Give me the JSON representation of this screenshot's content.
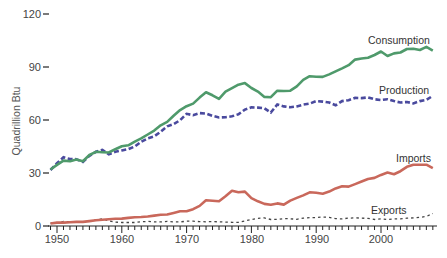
{
  "chart_data": {
    "type": "line",
    "title": "",
    "xlabel": "",
    "ylabel": "Quadrillion Btu",
    "ylim": [
      0,
      120
    ],
    "xlim": [
      1949,
      2008
    ],
    "yticks": [
      0,
      30,
      60,
      90,
      120
    ],
    "xticks": [
      1950,
      1960,
      1970,
      1980,
      1990,
      2000
    ],
    "grid": false,
    "legend": "direct labels at right",
    "x": [
      1949,
      1950,
      1951,
      1952,
      1953,
      1954,
      1955,
      1956,
      1957,
      1958,
      1959,
      1960,
      1961,
      1962,
      1963,
      1964,
      1965,
      1966,
      1967,
      1968,
      1969,
      1970,
      1971,
      1972,
      1973,
      1974,
      1975,
      1976,
      1977,
      1978,
      1979,
      1980,
      1981,
      1982,
      1983,
      1984,
      1985,
      1986,
      1987,
      1988,
      1989,
      1990,
      1991,
      1992,
      1993,
      1994,
      1995,
      1996,
      1997,
      1998,
      1999,
      2000,
      2001,
      2002,
      2003,
      2004,
      2005,
      2006,
      2007,
      2008
    ],
    "series": [
      {
        "name": "Consumption",
        "color": "#4f9a6b",
        "style": "solid",
        "values": [
          32.0,
          34.6,
          37.0,
          36.7,
          37.7,
          36.6,
          40.2,
          42.0,
          41.8,
          41.6,
          43.5,
          45.1,
          45.7,
          47.8,
          49.6,
          51.8,
          54.0,
          57.0,
          58.9,
          62.4,
          65.6,
          67.8,
          69.3,
          72.7,
          75.7,
          74.0,
          72.0,
          76.0,
          78.0,
          80.0,
          80.9,
          78.1,
          76.1,
          73.1,
          72.9,
          76.6,
          76.4,
          76.6,
          79.0,
          82.7,
          84.8,
          84.5,
          84.4,
          85.8,
          87.5,
          89.2,
          91.0,
          94.2,
          94.8,
          95.2,
          96.8,
          98.8,
          96.2,
          97.7,
          98.2,
          100.2,
          100.3,
          99.6,
          101.4,
          99.3
        ]
      },
      {
        "name": "Production",
        "color": "#4a4a9e",
        "style": "dashed",
        "values": [
          31.7,
          35.5,
          38.9,
          37.9,
          37.8,
          36.3,
          39.7,
          42.0,
          43.1,
          40.6,
          42.0,
          42.8,
          43.5,
          45.0,
          47.7,
          49.6,
          50.7,
          53.4,
          56.4,
          57.7,
          59.9,
          63.5,
          62.7,
          63.9,
          63.6,
          62.4,
          61.4,
          61.6,
          62.1,
          63.2,
          65.9,
          67.2,
          67.0,
          66.6,
          64.2,
          68.8,
          67.7,
          67.2,
          67.7,
          68.7,
          69.3,
          70.7,
          70.4,
          69.9,
          68.3,
          70.7,
          71.2,
          72.5,
          72.4,
          72.8,
          71.7,
          71.3,
          71.7,
          70.7,
          69.9,
          70.2,
          69.4,
          70.7,
          71.4,
          73.7
        ]
      },
      {
        "name": "Imports",
        "color": "#c9685b",
        "style": "solid",
        "values": [
          1.4,
          1.9,
          1.9,
          2.1,
          2.3,
          2.3,
          2.8,
          3.2,
          3.5,
          3.8,
          4.1,
          4.2,
          4.6,
          5.0,
          5.1,
          5.4,
          5.9,
          6.4,
          6.5,
          7.4,
          8.3,
          8.3,
          9.5,
          11.4,
          14.6,
          14.3,
          14.0,
          16.8,
          19.9,
          19.1,
          19.5,
          15.8,
          14.0,
          12.5,
          12.0,
          12.8,
          12.1,
          14.4,
          15.9,
          17.3,
          19.1,
          18.8,
          18.3,
          19.5,
          21.3,
          22.5,
          22.3,
          23.7,
          25.2,
          26.6,
          27.2,
          28.9,
          30.2,
          29.3,
          31.0,
          33.5,
          34.7,
          34.7,
          34.7,
          32.8
        ]
      },
      {
        "name": "Exports",
        "color": "#444444",
        "style": "dotted",
        "values": [
          1.6,
          1.5,
          2.6,
          2.4,
          2.3,
          2.3,
          2.8,
          3.4,
          4.1,
          2.9,
          2.2,
          2.0,
          2.0,
          2.0,
          2.4,
          2.6,
          2.4,
          2.3,
          2.6,
          2.3,
          2.3,
          2.7,
          2.7,
          2.5,
          2.4,
          2.5,
          2.4,
          2.2,
          2.1,
          2.1,
          2.9,
          3.7,
          4.3,
          4.6,
          3.7,
          3.8,
          4.2,
          4.1,
          3.8,
          4.4,
          4.7,
          4.8,
          5.1,
          4.9,
          4.2,
          4.0,
          4.5,
          4.6,
          4.5,
          4.3,
          3.7,
          4.0,
          3.7,
          4.0,
          4.1,
          4.4,
          4.6,
          4.9,
          5.4,
          7.1
        ]
      }
    ],
    "annotations": [
      {
        "text": "Consumption",
        "near_year": 2003,
        "near_value": 104
      },
      {
        "text": "Production",
        "near_year": 2004,
        "near_value": 77
      },
      {
        "text": "Imports",
        "near_year": 2005,
        "near_value": 39
      },
      {
        "text": "Exports",
        "near_year": 2001,
        "near_value": 9
      }
    ]
  },
  "axis": {
    "y_title": "Quadrillion Btu",
    "y_labels": [
      "0",
      "30",
      "60",
      "90",
      "120"
    ],
    "x_labels": [
      "1950",
      "1960",
      "1970",
      "1980",
      "1990",
      "2000"
    ]
  },
  "labels": {
    "consumption": "Consumption",
    "production": "Production",
    "imports": "Imports",
    "exports": "Exports"
  }
}
